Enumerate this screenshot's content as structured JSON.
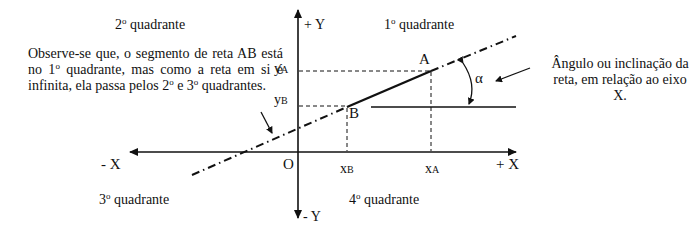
{
  "diagram": {
    "quadrants": {
      "q1": {
        "num": "1",
        "ord": "o",
        "label": " quadrante"
      },
      "q2": {
        "num": "2",
        "ord": "o",
        "label": " quadrante"
      },
      "q3": {
        "num": "3",
        "ord": "o",
        "label": " quadrante"
      },
      "q4": {
        "num": "4",
        "ord": "o",
        "label": " quadrante"
      }
    },
    "axes": {
      "x_pos": "+ X",
      "x_neg": "- X",
      "y_pos": "+ Y",
      "y_neg": "- Y",
      "origin": "O"
    },
    "points": {
      "A": "A",
      "B": "B"
    },
    "ticks": {
      "xA": {
        "main": "x",
        "sub": "A"
      },
      "xB": {
        "main": "x",
        "sub": "B"
      },
      "yA": {
        "main": "y",
        "sub": "A"
      },
      "yB": {
        "main": "y",
        "sub": "B"
      }
    },
    "angle_symbol": "α",
    "notes": {
      "left": {
        "p1": "Observe-se que, o segmento de reta AB está no 1",
        "o1": "o",
        "p2": " quadrante, mas como a reta em si é infinita, ela passa pelos 2",
        "o2": "o",
        "p3": " e 3",
        "o3": "o",
        "p4": " quadrantes."
      },
      "right": "Ângulo ou inclinação da reta, em relação ao eixo X."
    },
    "colors": {
      "ink": "#111111",
      "background": "#ffffff"
    }
  }
}
